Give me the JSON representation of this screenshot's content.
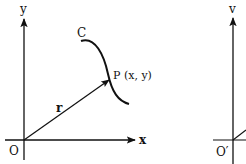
{
  "diagram": {
    "left_panel": {
      "y_axis_label": "y",
      "x_axis_label": "x",
      "origin_label": "O",
      "curve_label": "C",
      "point_label": "P (x, y)",
      "vector_label": "r"
    },
    "right_panel": {
      "axis_label": "v",
      "origin_label": "O′"
    },
    "colors": {
      "stroke": "#111111",
      "background": "#ffffff"
    }
  }
}
